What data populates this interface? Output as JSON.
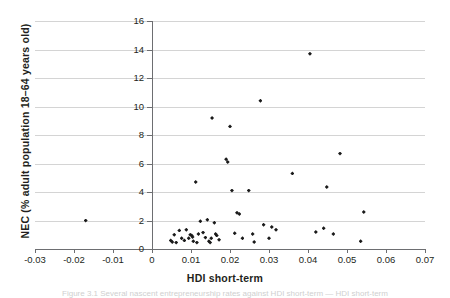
{
  "figure": {
    "caption_partial": "Figure 3.1 Several nascent entrepreneurship rates against HDI short-term — HDI short-term"
  },
  "chart_data": {
    "type": "scatter",
    "title": "",
    "xlabel": "HDI short-term",
    "ylabel": "NEC  (% adult population 18–64 years old)",
    "xlim": [
      -0.03,
      0.07
    ],
    "ylim": [
      0,
      16
    ],
    "xticks": [
      -0.03,
      -0.02,
      -0.01,
      0,
      0.01,
      0.02,
      0.03,
      0.04,
      0.05,
      0.06,
      0.07
    ],
    "xtick_labels": [
      "-0.03",
      "-0.02",
      "-0.01",
      "0",
      "0.01",
      "0.02",
      "0.03",
      "0.04",
      "0.05",
      "0.06",
      "0.07"
    ],
    "yticks": [
      0,
      2,
      4,
      6,
      8,
      10,
      12,
      14,
      16
    ],
    "ytick_labels": [
      "0",
      "2",
      "4",
      "6",
      "8",
      "10",
      "12",
      "14",
      "16"
    ],
    "grid": "horizontal",
    "legend": "none",
    "marker": "diamond",
    "marker_color": "#1a1a1a",
    "points": [
      {
        "x": -0.017,
        "y": 2.0
      },
      {
        "x": 0.0048,
        "y": 0.6
      },
      {
        "x": 0.0052,
        "y": 0.5
      },
      {
        "x": 0.0057,
        "y": 1.0
      },
      {
        "x": 0.0062,
        "y": 0.45
      },
      {
        "x": 0.007,
        "y": 1.3
      },
      {
        "x": 0.0076,
        "y": 0.75
      },
      {
        "x": 0.0083,
        "y": 0.6
      },
      {
        "x": 0.0088,
        "y": 1.35
      },
      {
        "x": 0.0094,
        "y": 0.75
      },
      {
        "x": 0.0098,
        "y": 1.0
      },
      {
        "x": 0.0102,
        "y": 0.95
      },
      {
        "x": 0.0104,
        "y": 0.85
      },
      {
        "x": 0.0106,
        "y": 0.55
      },
      {
        "x": 0.0112,
        "y": 4.7
      },
      {
        "x": 0.0115,
        "y": 0.45
      },
      {
        "x": 0.0119,
        "y": 1.05
      },
      {
        "x": 0.0124,
        "y": 1.95
      },
      {
        "x": 0.0131,
        "y": 1.15
      },
      {
        "x": 0.0137,
        "y": 0.8
      },
      {
        "x": 0.0142,
        "y": 2.05
      },
      {
        "x": 0.0146,
        "y": 0.55
      },
      {
        "x": 0.0149,
        "y": 0.45
      },
      {
        "x": 0.0152,
        "y": 0.75
      },
      {
        "x": 0.0154,
        "y": 9.2
      },
      {
        "x": 0.016,
        "y": 1.85
      },
      {
        "x": 0.0163,
        "y": 1.05
      },
      {
        "x": 0.0166,
        "y": 0.95
      },
      {
        "x": 0.0172,
        "y": 0.65
      },
      {
        "x": 0.019,
        "y": 6.3
      },
      {
        "x": 0.0194,
        "y": 6.1
      },
      {
        "x": 0.02,
        "y": 8.6
      },
      {
        "x": 0.0205,
        "y": 4.1
      },
      {
        "x": 0.0212,
        "y": 1.1
      },
      {
        "x": 0.0218,
        "y": 2.55
      },
      {
        "x": 0.0224,
        "y": 2.45
      },
      {
        "x": 0.0232,
        "y": 0.75
      },
      {
        "x": 0.0248,
        "y": 4.1
      },
      {
        "x": 0.0258,
        "y": 1.05
      },
      {
        "x": 0.0262,
        "y": 0.5
      },
      {
        "x": 0.0278,
        "y": 10.4
      },
      {
        "x": 0.0286,
        "y": 1.7
      },
      {
        "x": 0.03,
        "y": 0.75
      },
      {
        "x": 0.0307,
        "y": 1.55
      },
      {
        "x": 0.0318,
        "y": 1.35
      },
      {
        "x": 0.036,
        "y": 5.3
      },
      {
        "x": 0.0405,
        "y": 13.7
      },
      {
        "x": 0.042,
        "y": 1.2
      },
      {
        "x": 0.044,
        "y": 1.45
      },
      {
        "x": 0.0448,
        "y": 4.35
      },
      {
        "x": 0.0465,
        "y": 1.05
      },
      {
        "x": 0.0482,
        "y": 6.7
      },
      {
        "x": 0.0535,
        "y": 0.55
      },
      {
        "x": 0.0543,
        "y": 2.6
      }
    ]
  }
}
